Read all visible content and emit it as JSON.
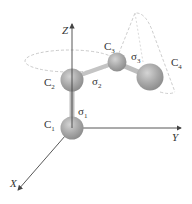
{
  "diagram": {
    "type": "molecular-chain-rotation",
    "axes": {
      "z": "Z",
      "y": "Y",
      "x": "X"
    },
    "atoms": [
      {
        "id": "C1",
        "base": "C",
        "sub": "1"
      },
      {
        "id": "C2",
        "base": "C",
        "sub": "2"
      },
      {
        "id": "C3",
        "base": "C",
        "sub": "3"
      },
      {
        "id": "C4",
        "base": "C",
        "sub": "4"
      }
    ],
    "bonds": [
      {
        "id": "sigma1",
        "base": "σ",
        "sub": "1"
      },
      {
        "id": "sigma2",
        "base": "σ",
        "sub": "2"
      },
      {
        "id": "sigma3",
        "base": "σ",
        "sub": "3"
      }
    ],
    "colors": {
      "atom": "#a8a8a8",
      "axis": "#444444",
      "dashed": "#b5b5b5"
    }
  }
}
